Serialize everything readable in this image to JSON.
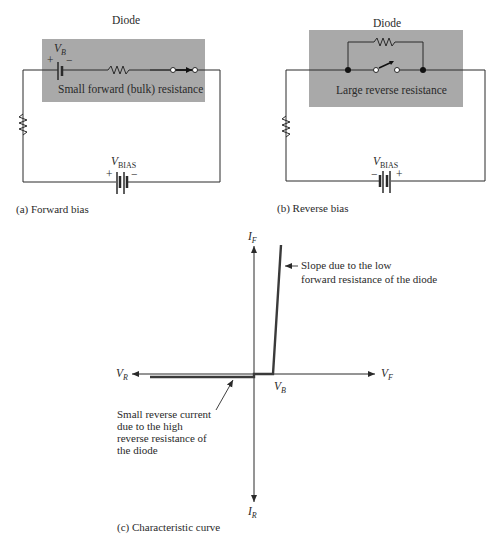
{
  "panel_a": {
    "title": "Diode",
    "battery_label": "V",
    "battery_sub": "B",
    "plus": "+",
    "minus": "−",
    "box_label": "Small forward (bulk) resistance",
    "bias_label": "V",
    "bias_sub": "BIAS",
    "bias_plus": "+",
    "bias_minus": "−",
    "caption": "(a) Forward bias"
  },
  "panel_b": {
    "title": "Diode",
    "box_label": "Large reverse resistance",
    "bias_label": "V",
    "bias_sub": "BIAS",
    "bias_plus": "+",
    "bias_minus": "−",
    "caption": "(b) Reverse bias"
  },
  "panel_c": {
    "caption": "(c) Characteristic curve",
    "axis_if": "I",
    "axis_if_sub": "F",
    "axis_ir": "I",
    "axis_ir_sub": "R",
    "axis_vf": "V",
    "axis_vf_sub": "F",
    "axis_vr": "V",
    "axis_vr_sub": "R",
    "knee": "V",
    "knee_sub": "B",
    "forward_note_line1": "Slope due to the low",
    "forward_note_line2": "forward resistance of the diode",
    "reverse_note_line1": "Small reverse current",
    "reverse_note_line2": "due to the high",
    "reverse_note_line3": "reverse resistance of",
    "reverse_note_line4": "the diode"
  },
  "colors": {
    "box_fill": "#a9a9a9",
    "line": "#2a2a2a",
    "curve": "#3a3a3a"
  }
}
